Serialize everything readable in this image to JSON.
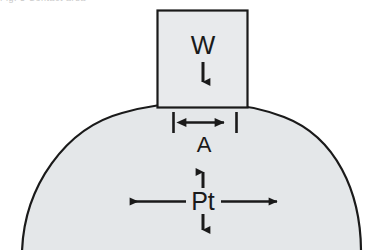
{
  "figure": {
    "background_color": "#ffffff",
    "clipped_caption_text": "Fig.   5   Contact area",
    "width": 380,
    "height": 250
  },
  "colors": {
    "body_fill": "#e4e7e9",
    "box_fill": "#e8eaec",
    "outline": "#1a1a1a",
    "label_color": "#1a1a1a",
    "arrow_color": "#1a1a1a"
  },
  "labels": {
    "load": "W",
    "contact_width": "A",
    "internal_pressure": "Pt"
  },
  "elements": {
    "dome": {
      "name": "pressurized-curved-body",
      "fill": "#e4e7e9",
      "stroke": "#1a1a1a",
      "stroke_width": 2
    },
    "indenter": {
      "name": "indenter-block",
      "fill": "#e8eaec",
      "stroke": "#1a1a1a",
      "stroke_width": 2,
      "x": 157,
      "y": 10,
      "width": 91,
      "height": 98
    },
    "load_arrow": {
      "name": "load-arrow",
      "direction": "down",
      "label": "W"
    },
    "contact_dimension": {
      "name": "contact-width-dimension",
      "label": "A",
      "style": "double-headed-with-end-ticks",
      "x_start": 173,
      "x_end": 236,
      "y": 122
    },
    "pressure_arrows": {
      "name": "internal-pressure-arrows",
      "label": "Pt",
      "directions": [
        "left",
        "right",
        "up",
        "down"
      ],
      "center_x": 203,
      "center_y": 201
    }
  }
}
